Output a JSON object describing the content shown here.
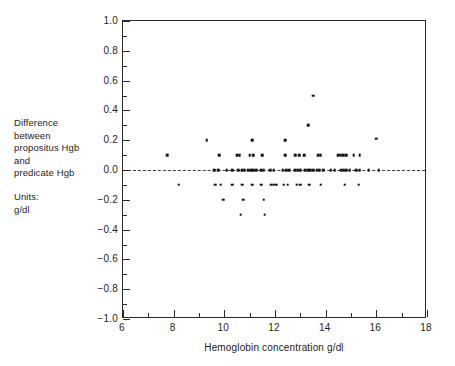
{
  "chart_data": {
    "type": "scatter",
    "title": "",
    "xlabel": "Hemoglobin concentration g/dl",
    "ylabel": "Difference between propositus Hgb and predicate Hgb",
    "units": "g/dl",
    "xlim": [
      6,
      18
    ],
    "ylim": [
      -1.0,
      1.0
    ],
    "grid": false,
    "legend": "none",
    "reference_line": {
      "y": 0.0,
      "style": "dashed"
    },
    "x_ticks_major": [
      6,
      8,
      10,
      12,
      14,
      16,
      18
    ],
    "x_ticks_major_labels": [
      "6",
      "8",
      "10",
      "12",
      "14",
      "16",
      "18"
    ],
    "x_ticks_minor": [
      7,
      9,
      11,
      13,
      15,
      17
    ],
    "y_ticks_major": [
      1.0,
      0.8,
      0.6,
      0.4,
      0.2,
      0.0,
      -0.2,
      -0.4,
      -0.6,
      -0.8,
      -1.0
    ],
    "y_ticks_major_labels": [
      "1.0",
      "0.8",
      "0.6",
      "0.4",
      "0.2",
      "0.0",
      "−0.2",
      "−0.4",
      "−0.6",
      "−0.8",
      "−1.0"
    ],
    "y_ticks_minor": [
      0.9,
      0.7,
      0.5,
      0.3,
      0.1,
      -0.1,
      -0.3,
      -0.5,
      -0.7,
      -0.9
    ],
    "marker": {
      "shape": "square",
      "size_px": 2.6,
      "color": "#111111"
    },
    "points": [
      [
        7.75,
        0.1
      ],
      [
        8.2,
        -0.1
      ],
      [
        9.3,
        0.2
      ],
      [
        9.6,
        0.0
      ],
      [
        9.75,
        0.0
      ],
      [
        9.8,
        0.1
      ],
      [
        9.65,
        -0.1
      ],
      [
        9.85,
        -0.1
      ],
      [
        9.95,
        -0.2
      ],
      [
        10.1,
        0.0
      ],
      [
        10.3,
        0.0
      ],
      [
        10.3,
        -0.1
      ],
      [
        10.5,
        0.1
      ],
      [
        10.6,
        0.1
      ],
      [
        10.55,
        0.0
      ],
      [
        10.7,
        0.0
      ],
      [
        10.8,
        0.0
      ],
      [
        10.7,
        -0.1
      ],
      [
        10.75,
        -0.2
      ],
      [
        10.65,
        -0.3
      ],
      [
        11.0,
        0.1
      ],
      [
        11.15,
        0.1
      ],
      [
        11.1,
        0.2
      ],
      [
        10.95,
        0.0
      ],
      [
        11.05,
        0.0
      ],
      [
        11.15,
        0.0
      ],
      [
        11.25,
        0.0
      ],
      [
        11.1,
        -0.1
      ],
      [
        11.5,
        0.1
      ],
      [
        11.45,
        0.0
      ],
      [
        11.55,
        0.0
      ],
      [
        11.45,
        -0.1
      ],
      [
        11.55,
        -0.2
      ],
      [
        11.6,
        -0.3
      ],
      [
        11.8,
        0.0
      ],
      [
        11.95,
        0.0
      ],
      [
        11.85,
        -0.1
      ],
      [
        11.95,
        -0.1
      ],
      [
        12.05,
        -0.1
      ],
      [
        12.4,
        0.2
      ],
      [
        12.4,
        0.1
      ],
      [
        12.3,
        0.0
      ],
      [
        12.45,
        0.0
      ],
      [
        12.55,
        0.0
      ],
      [
        12.35,
        -0.1
      ],
      [
        12.5,
        -0.1
      ],
      [
        12.8,
        0.1
      ],
      [
        12.95,
        0.1
      ],
      [
        12.8,
        0.0
      ],
      [
        12.9,
        0.0
      ],
      [
        13.0,
        0.0
      ],
      [
        12.85,
        -0.1
      ],
      [
        13.0,
        -0.1
      ],
      [
        13.15,
        0.1
      ],
      [
        13.3,
        0.3
      ],
      [
        13.5,
        0.5
      ],
      [
        13.2,
        0.0
      ],
      [
        13.3,
        0.0
      ],
      [
        13.4,
        0.0
      ],
      [
        13.5,
        0.0
      ],
      [
        13.35,
        -0.1
      ],
      [
        13.7,
        0.1
      ],
      [
        13.8,
        0.1
      ],
      [
        13.65,
        0.0
      ],
      [
        13.75,
        0.0
      ],
      [
        13.9,
        0.0
      ],
      [
        13.8,
        -0.1
      ],
      [
        14.2,
        0.0
      ],
      [
        14.35,
        0.0
      ],
      [
        14.5,
        0.1
      ],
      [
        14.6,
        0.1
      ],
      [
        14.7,
        0.1
      ],
      [
        14.8,
        0.1
      ],
      [
        14.6,
        0.0
      ],
      [
        14.7,
        0.0
      ],
      [
        14.8,
        0.0
      ],
      [
        14.95,
        0.0
      ],
      [
        14.75,
        -0.1
      ],
      [
        15.1,
        0.1
      ],
      [
        15.35,
        0.1
      ],
      [
        15.2,
        0.0
      ],
      [
        15.35,
        0.0
      ],
      [
        15.3,
        -0.1
      ],
      [
        15.7,
        0.0
      ],
      [
        16.0,
        0.21
      ],
      [
        16.1,
        0.0
      ]
    ]
  },
  "annotation": {
    "lines": [
      "Difference",
      "between",
      "propositus Hgb",
      "and",
      "predicate Hgb"
    ],
    "units_lines": [
      "Units:",
      "g/dl"
    ]
  },
  "axis": {
    "x_title": "Hemoglobin concentration g/dl"
  },
  "colors": {
    "frame": "#2a2a2a",
    "marker": "#111111",
    "reference_line": "#3a3a3a",
    "text": "#1d1d1d",
    "background": "#ffffff"
  }
}
